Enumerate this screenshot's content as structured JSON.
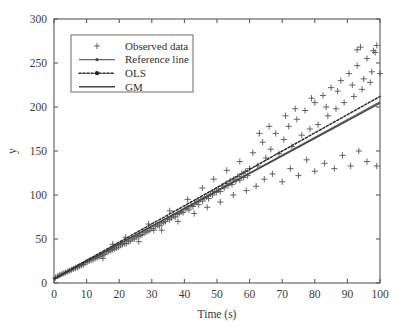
{
  "chart_data": {
    "type": "scatter",
    "title": "",
    "xlabel": "Time (s)",
    "ylabel": "y",
    "xlim": [
      0,
      100
    ],
    "ylim": [
      0,
      300
    ],
    "xticks": [
      0,
      10,
      20,
      30,
      40,
      50,
      60,
      70,
      80,
      90,
      100
    ],
    "yticks": [
      0,
      50,
      100,
      150,
      200,
      250,
      300
    ],
    "grid": false,
    "legend_position": "upper-left",
    "legend": [
      {
        "label": "Observed data",
        "style": "marker-plus"
      },
      {
        "label": "Reference line",
        "style": "solid-with-marker"
      },
      {
        "label": "OLS",
        "style": "dotted-with-marker"
      },
      {
        "label": "GM",
        "style": "solid"
      }
    ],
    "series": [
      {
        "name": "Observed data",
        "type": "scatter",
        "marker": "+",
        "color": "#555555",
        "points": [
          [
            0.5,
            6
          ],
          [
            1.2,
            8
          ],
          [
            1.8,
            9
          ],
          [
            2.4,
            10
          ],
          [
            3.0,
            11
          ],
          [
            3.6,
            12
          ],
          [
            4.2,
            13
          ],
          [
            4.8,
            14
          ],
          [
            5.4,
            15
          ],
          [
            6.0,
            16
          ],
          [
            6.6,
            17
          ],
          [
            7.2,
            18
          ],
          [
            7.8,
            19
          ],
          [
            8.4,
            20
          ],
          [
            9.0,
            21
          ],
          [
            9.6,
            23
          ],
          [
            10.2,
            24
          ],
          [
            10.8,
            25
          ],
          [
            11.4,
            26
          ],
          [
            12.0,
            27
          ],
          [
            12.6,
            28
          ],
          [
            13.2,
            29
          ],
          [
            13.8,
            30
          ],
          [
            14.4,
            31
          ],
          [
            15.0,
            32
          ],
          [
            15.6,
            33
          ],
          [
            16.2,
            35
          ],
          [
            16.8,
            36
          ],
          [
            17.4,
            37
          ],
          [
            18.0,
            38
          ],
          [
            18.6,
            39
          ],
          [
            19.2,
            40
          ],
          [
            19.8,
            41
          ],
          [
            20.4,
            43
          ],
          [
            21.0,
            44
          ],
          [
            21.6,
            45
          ],
          [
            22.2,
            45
          ],
          [
            22.8,
            47
          ],
          [
            23.4,
            48
          ],
          [
            24.0,
            50
          ],
          [
            24.6,
            50
          ],
          [
            25.2,
            52
          ],
          [
            25.8,
            53
          ],
          [
            26.4,
            54
          ],
          [
            27.0,
            55
          ],
          [
            27.6,
            57
          ],
          [
            28.2,
            58
          ],
          [
            28.8,
            59
          ],
          [
            29.4,
            60
          ],
          [
            30.0,
            62
          ],
          [
            30.6,
            60
          ],
          [
            31.2,
            64
          ],
          [
            31.8,
            66
          ],
          [
            32.4,
            65
          ],
          [
            33.0,
            68
          ],
          [
            33.6,
            69
          ],
          [
            34.2,
            70
          ],
          [
            34.8,
            73
          ],
          [
            35.4,
            72
          ],
          [
            36.0,
            74
          ],
          [
            36.6,
            76
          ],
          [
            37.2,
            75
          ],
          [
            37.8,
            78
          ],
          [
            38.4,
            79
          ],
          [
            39.0,
            81
          ],
          [
            39.6,
            80
          ],
          [
            40.2,
            84
          ],
          [
            40.8,
            85
          ],
          [
            41.4,
            83
          ],
          [
            42.0,
            88
          ],
          [
            42.6,
            87
          ],
          [
            43.2,
            90
          ],
          [
            43.8,
            92
          ],
          [
            44.4,
            89
          ],
          [
            45.0,
            95
          ],
          [
            45.6,
            93
          ],
          [
            46.2,
            97
          ],
          [
            46.8,
            98
          ],
          [
            47.4,
            96
          ],
          [
            48.0,
            101
          ],
          [
            48.6,
            100
          ],
          [
            49.2,
            104
          ],
          [
            49.8,
            103
          ],
          [
            50.4,
            107
          ],
          [
            51.0,
            104
          ],
          [
            51.6,
            110
          ],
          [
            52.2,
            108
          ],
          [
            52.8,
            113
          ],
          [
            53.4,
            111
          ],
          [
            54.0,
            116
          ],
          [
            54.6,
            112
          ],
          [
            55.2,
            118
          ],
          [
            55.8,
            116
          ],
          [
            56.4,
            121
          ],
          [
            57.0,
            117
          ],
          [
            57.6,
            124
          ],
          [
            58.2,
            120
          ],
          [
            58.8,
            127
          ],
          [
            59.4,
            122
          ],
          [
            60.0,
            130
          ],
          [
            15.0,
            28
          ],
          [
            18.0,
            44
          ],
          [
            22.0,
            52
          ],
          [
            26.0,
            47
          ],
          [
            29.0,
            67
          ],
          [
            33.0,
            60
          ],
          [
            35.5,
            82
          ],
          [
            38.0,
            70
          ],
          [
            41.0,
            95
          ],
          [
            43.0,
            79
          ],
          [
            45.5,
            108
          ],
          [
            47.0,
            86
          ],
          [
            49.0,
            118
          ],
          [
            51.0,
            92
          ],
          [
            53.0,
            128
          ],
          [
            55.0,
            100
          ],
          [
            57.0,
            138
          ],
          [
            59.0,
            105
          ],
          [
            61.0,
            148
          ],
          [
            62.5,
            133
          ],
          [
            64.0,
            160
          ],
          [
            65.0,
            142
          ],
          [
            66.5,
            152
          ],
          [
            68.0,
            170
          ],
          [
            69.0,
            147
          ],
          [
            70.5,
            163
          ],
          [
            72.0,
            178
          ],
          [
            73.0,
            155
          ],
          [
            74.5,
            186
          ],
          [
            76.0,
            168
          ],
          [
            77.0,
            196
          ],
          [
            78.5,
            175
          ],
          [
            80.0,
            205
          ],
          [
            81.0,
            180
          ],
          [
            82.5,
            213
          ],
          [
            84.0,
            190
          ],
          [
            85.0,
            222
          ],
          [
            86.5,
            198
          ],
          [
            88.0,
            230
          ],
          [
            89.0,
            205
          ],
          [
            90.5,
            238
          ],
          [
            92.0,
            212
          ],
          [
            93.0,
            247
          ],
          [
            94.5,
            220
          ],
          [
            96.0,
            255
          ],
          [
            97.0,
            228
          ],
          [
            98.5,
            262
          ],
          [
            100.0,
            238
          ],
          [
            93.0,
            265
          ],
          [
            94.0,
            268
          ],
          [
            99.0,
            270
          ],
          [
            98.0,
            264
          ],
          [
            62.0,
            110
          ],
          [
            64.5,
            118
          ],
          [
            67.0,
            124
          ],
          [
            70.0,
            115
          ],
          [
            72.5,
            130
          ],
          [
            75.0,
            122
          ],
          [
            77.5,
            140
          ],
          [
            80.0,
            127
          ],
          [
            83.0,
            136
          ],
          [
            86.0,
            130
          ],
          [
            88.5,
            145
          ],
          [
            91.0,
            133
          ],
          [
            93.5,
            150
          ],
          [
            96.0,
            138
          ],
          [
            99.0,
            133
          ],
          [
            63.0,
            170
          ],
          [
            66.0,
            178
          ],
          [
            71.0,
            190
          ],
          [
            74.0,
            198
          ],
          [
            79.0,
            210
          ],
          [
            83.5,
            200
          ],
          [
            87.0,
            218
          ],
          [
            91.5,
            225
          ],
          [
            95.0,
            232
          ],
          [
            97.5,
            240
          ]
        ]
      },
      {
        "name": "Reference line",
        "type": "line",
        "color": "#666666",
        "slope": 2.02,
        "intercept": 4.0,
        "endpoints": [
          [
            0,
            4
          ],
          [
            100,
            206
          ]
        ]
      },
      {
        "name": "OLS",
        "type": "line",
        "color": "#2e2e2e",
        "slope": 2.07,
        "intercept": 5.0,
        "endpoints": [
          [
            0,
            5
          ],
          [
            100,
            212
          ]
        ]
      },
      {
        "name": "GM",
        "type": "line",
        "color": "#444444",
        "slope": 2.0,
        "intercept": 4.5,
        "endpoints": [
          [
            0,
            4.5
          ],
          [
            100,
            204.5
          ]
        ]
      }
    ]
  }
}
